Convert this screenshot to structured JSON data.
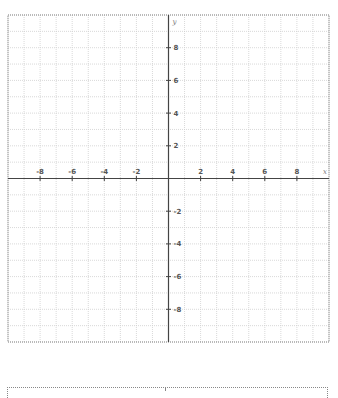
{
  "chart_data": {
    "type": "scatter",
    "title": "",
    "xlabel": "x",
    "ylabel": "y",
    "xlim": [
      -10,
      10
    ],
    "ylim": [
      -10,
      10
    ],
    "grid": true,
    "grid_step": 1,
    "x_ticks": [
      -8,
      -6,
      -4,
      -2,
      2,
      4,
      6,
      8
    ],
    "y_ticks": [
      8,
      6,
      4,
      2,
      -2,
      -4,
      -6,
      -8
    ],
    "x_tick_labels": [
      "-8",
      "-6",
      "-4",
      "-2",
      "2",
      "4",
      "6",
      "8"
    ],
    "y_tick_labels": [
      "8",
      "6",
      "4",
      "2",
      "-2",
      "-4",
      "-6",
      "-8"
    ],
    "series": []
  },
  "colors": {
    "grid": "#cfcfcf",
    "axis": "#444444",
    "border": "#888888",
    "label": "#555555"
  },
  "geometry": {
    "left": 8,
    "top": 15,
    "right": 329,
    "bottom": 342
  }
}
